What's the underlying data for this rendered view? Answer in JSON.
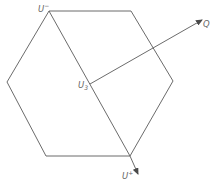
{
  "diagram": {
    "type": "hexagon-vector-diagram",
    "hexagon": {
      "vertices": [
        [
          49,
          11
        ],
        [
          131,
          11
        ],
        [
          173,
          81
        ],
        [
          130,
          156
        ],
        [
          46,
          156
        ],
        [
          7,
          82
        ]
      ]
    },
    "diagonal": {
      "from": "U-",
      "to": "U+"
    },
    "labels": {
      "u_minus": {
        "base": "U",
        "mark": "−"
      },
      "u_center": {
        "base": "U",
        "mark": "3"
      },
      "u_plus": {
        "base": "U",
        "mark": "+"
      },
      "q": {
        "base": "Q"
      }
    },
    "arrows": [
      {
        "from": "U3",
        "to": "Q"
      },
      {
        "from": "U+ vertex",
        "to": "U+ label"
      }
    ],
    "colors": {
      "stroke": "#5a5a5a",
      "label": "#666666",
      "background": "#ffffff"
    }
  }
}
